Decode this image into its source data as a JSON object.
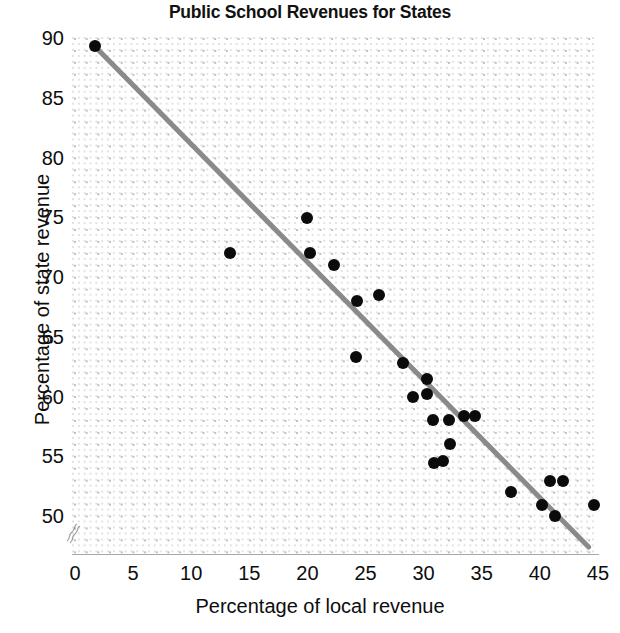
{
  "chart_data": {
    "type": "scatter",
    "title": "Public School Revenues for States",
    "xlabel": "Percentage of local revenue",
    "ylabel": "Percentage of state revenue",
    "xlim": [
      0,
      45
    ],
    "ylim": [
      47,
      90
    ],
    "x_ticks": [
      0,
      5,
      10,
      15,
      20,
      25,
      30,
      35,
      40,
      45
    ],
    "y_ticks": [
      50,
      55,
      60,
      65,
      70,
      75,
      80,
      85,
      90
    ],
    "grid": true,
    "grid_style": "fine dotted",
    "y_axis_break": true,
    "legend": "none",
    "marker_color": "#0b0b0b",
    "trend_line_color": "#8a8a8a",
    "trend_line": {
      "label": "least-squares regression line",
      "x_start": 1.7,
      "y_start": 89.3,
      "x_end": 44.2,
      "y_end": 47.4
    },
    "points": [
      {
        "x": 1.7,
        "y": 89.3
      },
      {
        "x": 13.3,
        "y": 72.0
      },
      {
        "x": 20.0,
        "y": 74.9
      },
      {
        "x": 20.2,
        "y": 72.0
      },
      {
        "x": 22.3,
        "y": 71.0
      },
      {
        "x": 24.2,
        "y": 63.3
      },
      {
        "x": 24.3,
        "y": 68.0
      },
      {
        "x": 26.2,
        "y": 68.5
      },
      {
        "x": 28.2,
        "y": 62.8
      },
      {
        "x": 30.3,
        "y": 61.5
      },
      {
        "x": 29.1,
        "y": 60.0
      },
      {
        "x": 30.3,
        "y": 60.2
      },
      {
        "x": 30.8,
        "y": 58.0
      },
      {
        "x": 32.2,
        "y": 58.0
      },
      {
        "x": 33.5,
        "y": 58.4
      },
      {
        "x": 34.4,
        "y": 58.4
      },
      {
        "x": 32.3,
        "y": 56.0
      },
      {
        "x": 31.7,
        "y": 54.6
      },
      {
        "x": 30.9,
        "y": 54.4
      },
      {
        "x": 37.5,
        "y": 52.0
      },
      {
        "x": 40.9,
        "y": 52.9
      },
      {
        "x": 42.0,
        "y": 52.9
      },
      {
        "x": 40.2,
        "y": 50.9
      },
      {
        "x": 41.3,
        "y": 50.0
      },
      {
        "x": 44.7,
        "y": 50.9
      }
    ]
  }
}
